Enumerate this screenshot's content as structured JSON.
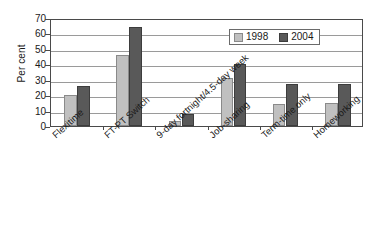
{
  "chart_data": {
    "type": "bar",
    "title": "",
    "xlabel": "",
    "ylabel": "Per cent",
    "ylim": [
      0,
      70
    ],
    "yticks": [
      0,
      10,
      20,
      30,
      40,
      50,
      60,
      70
    ],
    "grid": true,
    "legend_position": "top-right",
    "categories": [
      "Flexitime",
      "FT-PT Switch",
      "9-day fortnight/4.5-day week",
      "Job-sharing",
      "Term-time only",
      "Homeworking"
    ],
    "series": [
      {
        "name": "1998",
        "color": "#c0c0c0",
        "values": [
          20,
          46,
          3,
          31,
          14,
          15
        ]
      },
      {
        "name": "2004",
        "color": "#595959",
        "values": [
          26,
          64,
          8,
          40,
          27,
          27
        ]
      }
    ]
  },
  "legend": {
    "items": [
      {
        "label": "1998",
        "swatch": "legend-swatch-1998"
      },
      {
        "label": "2004",
        "swatch": "legend-swatch-2004"
      }
    ]
  },
  "caption": {
    "text": ""
  }
}
